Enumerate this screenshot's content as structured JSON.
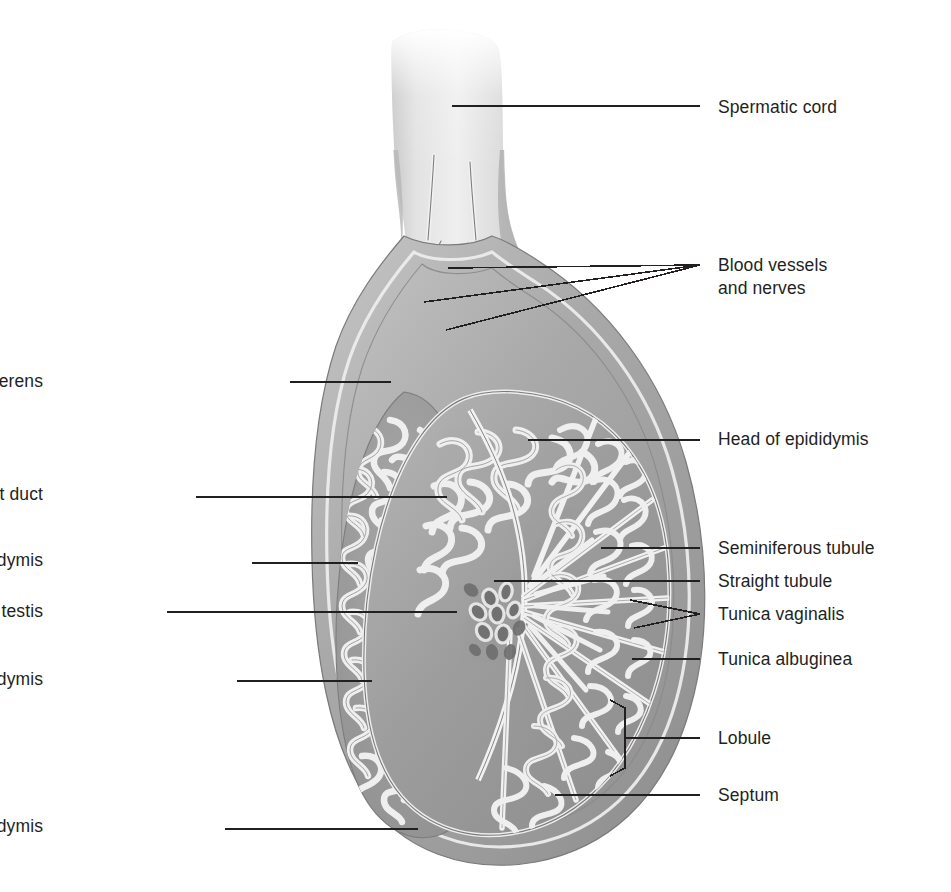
{
  "figure": {
    "background_color": "#ffffff",
    "line_color": "#231f20",
    "palette": {
      "tissue_mid": "#9a9a9a",
      "tissue_dark": "#7c7c7c",
      "tissue_light": "#c9c9c9",
      "tubule_highlight": "#efefef",
      "cord_light": "#dcdcdc",
      "capsule": "#b4b4b4",
      "rete_dark": "#6f6f6f"
    }
  },
  "labels": {
    "left": [
      {
        "id": "ductus-vas-deferens",
        "text": "Ductus (vas) deferens",
        "x": 45,
        "y": 370,
        "leader_from_x": 290,
        "leader_to_x": 391,
        "leader_y": 382
      },
      {
        "id": "efferent-duct",
        "text": "Efferent duct",
        "x": 45,
        "y": 483,
        "leader_from_x": 196,
        "leader_to_x": 447,
        "leader_y": 497
      },
      {
        "id": "body-of-epididymis",
        "text": "Body of epididymis",
        "x": 45,
        "y": 549,
        "leader_from_x": 252,
        "leader_to_x": 358,
        "leader_y": 563
      },
      {
        "id": "rete-testis",
        "text": "Rete testis",
        "x": 45,
        "y": 600,
        "leader_from_x": 167,
        "leader_to_x": 457,
        "leader_y": 612
      },
      {
        "id": "ductus-epididymis",
        "text": "Ductus epididymis",
        "x": 45,
        "y": 668,
        "leader_from_x": 237,
        "leader_to_x": 372,
        "leader_y": 681
      },
      {
        "id": "tail-of-epididymis",
        "text": "Tail of epididymis",
        "x": 45,
        "y": 815,
        "leader_from_x": 225,
        "leader_to_x": 418,
        "leader_y": 829
      }
    ],
    "right": [
      {
        "id": "spermatic-cord",
        "text": "Spermatic cord",
        "x": 718,
        "y": 96,
        "leader_from_x": 452,
        "leader_to_x": 700,
        "leader_y": 106
      },
      {
        "id": "blood-vessels-and-nerves",
        "line1": "Blood vessels",
        "line2": "and nerves",
        "x": 718,
        "y": 256
      },
      {
        "id": "head-of-epididymis",
        "text": "Head of epididymis",
        "x": 718,
        "y": 428,
        "leader_from_x": 528,
        "leader_to_x": 700,
        "leader_y": 440
      },
      {
        "id": "seminiferous-tubule",
        "text": "Seminiferous tubule",
        "x": 718,
        "y": 537,
        "leader_from_x": 601,
        "leader_to_x": 700,
        "leader_y": 548
      },
      {
        "id": "straight-tubule",
        "text": "Straight tubule",
        "x": 718,
        "y": 570,
        "leader_from_x": 494,
        "leader_to_x": 700,
        "leader_y": 581
      },
      {
        "id": "tunica-vaginalis",
        "text": "Tunica vaginalis",
        "x": 718,
        "y": 603,
        "leader_to_x": 700,
        "leader_y": 614
      },
      {
        "id": "tunica-albuginea",
        "text": "Tunica albuginea",
        "x": 718,
        "y": 648,
        "leader_from_x": 632,
        "leader_to_x": 700,
        "leader_y": 659
      },
      {
        "id": "lobule",
        "text": "Lobule",
        "x": 718,
        "y": 727,
        "leader_from_x": 625,
        "leader_to_x": 700,
        "leader_y": 738
      },
      {
        "id": "septum",
        "text": "Septum",
        "x": 718,
        "y": 784,
        "leader_from_x": 555,
        "leader_to_x": 700,
        "leader_y": 795
      }
    ]
  },
  "structures": [
    "spermatic cord",
    "ductus (vas) deferens",
    "blood vessels and nerves (pampiniform plexus)",
    "head of epididymis",
    "body of epididymis",
    "tail of epididymis",
    "ductus epididymis",
    "efferent duct",
    "rete testis",
    "straight tubule",
    "seminiferous tubule",
    "lobule",
    "septum",
    "tunica albuginea",
    "tunica vaginalis"
  ]
}
